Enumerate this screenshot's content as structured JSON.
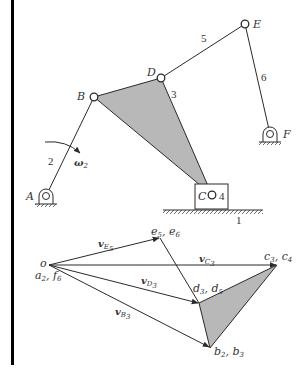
{
  "figure": {
    "colors": {
      "line": "#2a2a2a",
      "shade": "#b8b8b8",
      "border": "#000000",
      "background": "#ffffff"
    },
    "mechanism": {
      "joints": {
        "A": {
          "label": "A"
        },
        "B": {
          "label": "B"
        },
        "C": {
          "label": "C"
        },
        "D": {
          "label": "D"
        },
        "E": {
          "label": "E"
        },
        "F": {
          "label": "F"
        }
      },
      "links": {
        "ground": "1",
        "crank": "2",
        "coupler_triangle": "3",
        "slider": "4",
        "link5": "5",
        "link6": "6"
      },
      "angular_velocity": {
        "symbol": "ω",
        "subscript": "2"
      }
    },
    "velocity_polygon": {
      "pole": {
        "label": "o"
      },
      "pole_images": {
        "main": "a",
        "s1": "2",
        "sep": ", ",
        "main2": "f",
        "s2": "6"
      },
      "points": {
        "e": {
          "p1": "e",
          "s1": "5",
          "sep": ", ",
          "p2": "e",
          "s2": "6"
        },
        "c": {
          "p1": "c",
          "s1": "3",
          "sep": ", ",
          "p2": "c",
          "s2": "4"
        },
        "d": {
          "p1": "d",
          "s1": "3",
          "sep": ", ",
          "p2": "d",
          "s2": "5"
        },
        "b": {
          "p1": "b",
          "s1": "2",
          "sep": ", ",
          "p2": "b",
          "s2": "3"
        }
      },
      "vectors": {
        "vE": {
          "symbol": "v",
          "sub": "E",
          "subsub": "5"
        },
        "vC": {
          "symbol": "v",
          "sub": "C",
          "subsub": "3"
        },
        "vD": {
          "symbol": "v",
          "sub": "D",
          "subsub": "3"
        },
        "vB": {
          "symbol": "v",
          "sub": "B",
          "subsub": "3"
        }
      }
    }
  }
}
